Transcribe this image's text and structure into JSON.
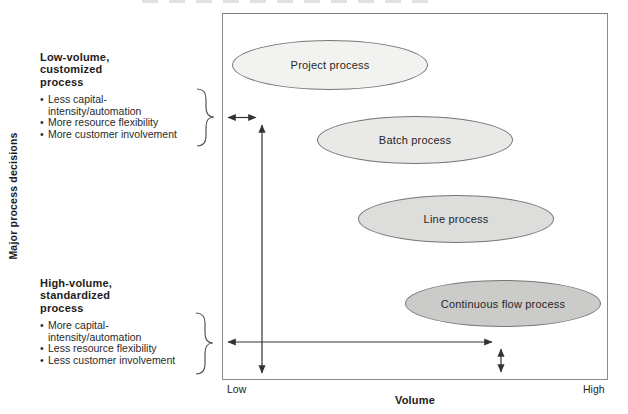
{
  "axes": {
    "y_label": "Major process decisions",
    "x_label": "Volume",
    "x_min_label": "Low",
    "x_max_label": "High"
  },
  "glyphs": {
    "bullet": "•"
  },
  "annotations": {
    "low_volume": {
      "title_lines": [
        "Low-volume,",
        "customized",
        "process"
      ],
      "bullets": [
        "Less capital-intensity/automation",
        "More resource flexibility",
        "More customer involvement"
      ]
    },
    "high_volume": {
      "title_lines": [
        "High-volume,",
        "standardized",
        "process"
      ],
      "bullets": [
        "More capital-intensity/automation",
        "Less resource flexibility",
        "Less customer involvement"
      ]
    }
  },
  "processes": [
    {
      "label": "Project process",
      "fill": "#f2f2f0"
    },
    {
      "label": "Batch process",
      "fill": "#e9e9e7"
    },
    {
      "label": "Line process",
      "fill": "#dddddb"
    },
    {
      "label": "Continuous flow process",
      "fill": "#cbcbc9"
    }
  ],
  "colors": {
    "box_border": "#8a8a8a",
    "ellipse_border": "#767674",
    "arrow": "#333333",
    "brace": "#555555",
    "text": "#222222"
  }
}
